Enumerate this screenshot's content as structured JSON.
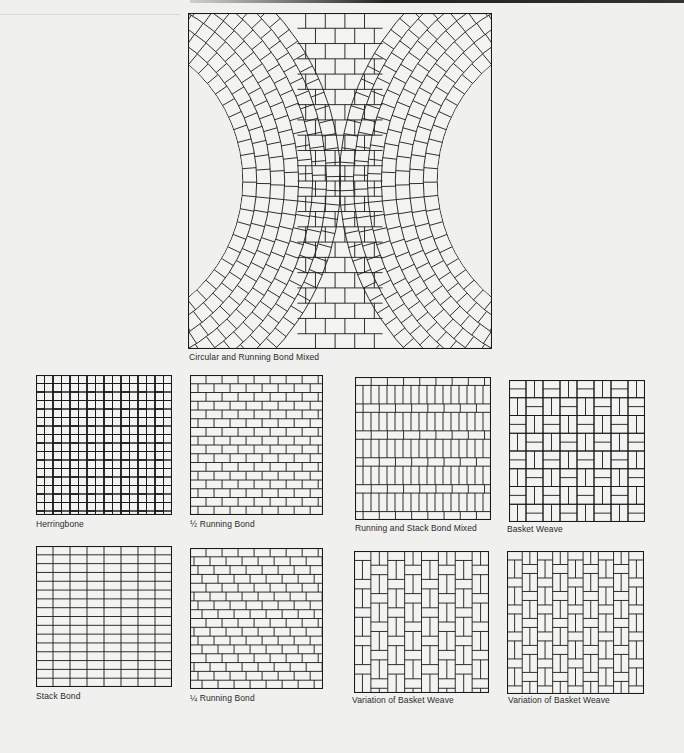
{
  "page": {
    "background": "#f0f0ee",
    "line_color": "#1a1a1a",
    "brick_fill": "#f3f3f1"
  },
  "figures": [
    {
      "id": "circular-running",
      "caption": "Circular and Running Bond Mixed",
      "pattern": "circular",
      "box": [
        188,
        13,
        304,
        336
      ],
      "caption_pos": [
        189,
        352
      ]
    },
    {
      "id": "herringbone",
      "caption": "Herringbone",
      "pattern": "herringbone",
      "box": [
        36,
        375,
        136,
        140
      ],
      "caption_pos": [
        36,
        519
      ]
    },
    {
      "id": "half-running",
      "caption": "½ Running Bond",
      "pattern": "half-running",
      "box": [
        190,
        375,
        133,
        140
      ],
      "caption_pos": [
        190,
        519
      ]
    },
    {
      "id": "running-stack",
      "caption": "Running and Stack Bond Mixed",
      "pattern": "running-stack",
      "box": [
        355,
        377,
        136,
        143
      ],
      "caption_pos": [
        355,
        523
      ]
    },
    {
      "id": "basket-weave",
      "caption": "Basket Weave",
      "pattern": "basket",
      "box": [
        509,
        380,
        136,
        142
      ],
      "caption_pos": [
        507,
        524
      ]
    },
    {
      "id": "stack-bond",
      "caption": "Stack Bond",
      "pattern": "stack",
      "box": [
        36,
        546,
        136,
        141
      ],
      "caption_pos": [
        36,
        691
      ]
    },
    {
      "id": "quarter-running",
      "caption": "¼ Running Bond",
      "pattern": "quarter-running",
      "box": [
        190,
        548,
        133,
        141
      ],
      "caption_pos": [
        190,
        693
      ]
    },
    {
      "id": "variation-basket-1",
      "caption": "Variation of Basket Weave",
      "pattern": "basket-var1",
      "box": [
        354,
        551,
        135,
        142
      ],
      "caption_pos": [
        352,
        695
      ]
    },
    {
      "id": "variation-basket-2",
      "caption": "Variation of Basket Weave",
      "pattern": "basket-var2",
      "box": [
        507,
        551,
        137,
        143
      ],
      "caption_pos": [
        508,
        695
      ]
    }
  ]
}
